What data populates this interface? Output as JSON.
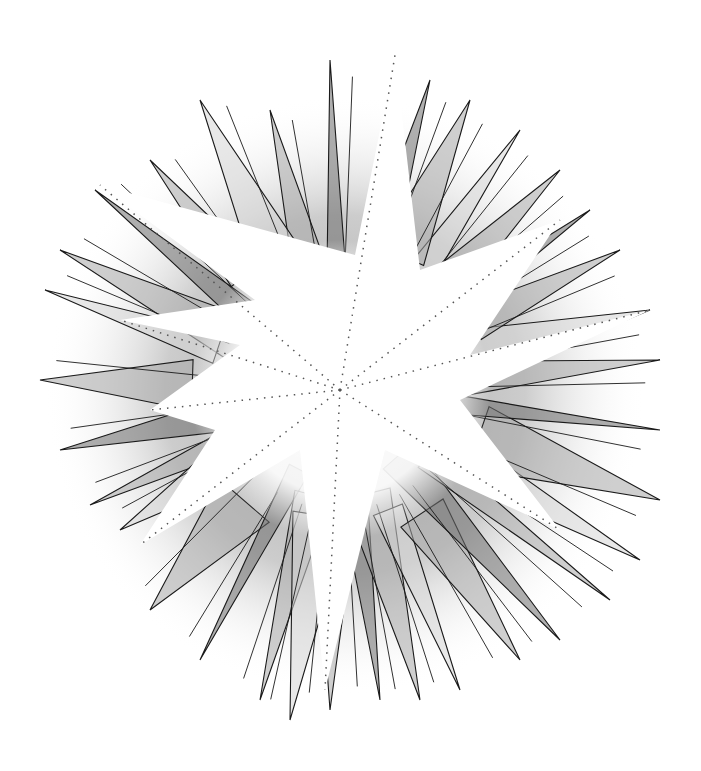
{
  "artwork": {
    "subject": "starburst illustration",
    "center": [
      340,
      390
    ],
    "colors": {
      "background": "#ffffff",
      "line": "#1a1a1a",
      "shade_dark": "#6e6e6e",
      "shade_mid": "#a8a8a8",
      "shade_light": "#d6d6d6",
      "star_fill": "#ffffff"
    },
    "main_star_points": [
      [
        395,
        55
      ],
      [
        355,
        255
      ],
      [
        100,
        185
      ],
      [
        255,
        300
      ],
      [
        120,
        320
      ],
      [
        240,
        345
      ],
      [
        150,
        410
      ],
      [
        215,
        430
      ],
      [
        140,
        545
      ],
      [
        300,
        450
      ],
      [
        325,
        690
      ],
      [
        385,
        450
      ],
      [
        560,
        530
      ],
      [
        460,
        400
      ],
      [
        650,
        310
      ],
      [
        470,
        355
      ],
      [
        560,
        220
      ],
      [
        420,
        270
      ]
    ],
    "spikes": [
      [
        330,
        60
      ],
      [
        270,
        110
      ],
      [
        200,
        100
      ],
      [
        150,
        160
      ],
      [
        95,
        190
      ],
      [
        60,
        250
      ],
      [
        45,
        290
      ],
      [
        40,
        380
      ],
      [
        60,
        450
      ],
      [
        90,
        505
      ],
      [
        120,
        530
      ],
      [
        150,
        610
      ],
      [
        200,
        660
      ],
      [
        260,
        700
      ],
      [
        290,
        720
      ],
      [
        330,
        710
      ],
      [
        380,
        700
      ],
      [
        420,
        700
      ],
      [
        460,
        690
      ],
      [
        520,
        660
      ],
      [
        560,
        640
      ],
      [
        610,
        600
      ],
      [
        640,
        560
      ],
      [
        660,
        500
      ],
      [
        660,
        430
      ],
      [
        660,
        360
      ],
      [
        650,
        310
      ],
      [
        620,
        250
      ],
      [
        590,
        210
      ],
      [
        560,
        170
      ],
      [
        520,
        130
      ],
      [
        470,
        100
      ],
      [
        430,
        80
      ]
    ]
  }
}
